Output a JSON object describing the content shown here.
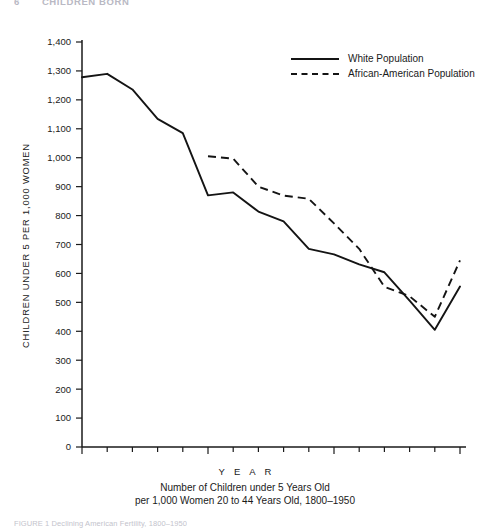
{
  "page": {
    "running_head": {
      "number": "6",
      "text": "CHILDREN BORN"
    },
    "source_note": "FIGURE 1  Declining American Fertility, 1800–1950"
  },
  "legend": {
    "position": "top-right",
    "items": [
      {
        "label": "White Population",
        "style": "solid"
      },
      {
        "label": "African-American Population",
        "style": "dashed"
      }
    ]
  },
  "labels": {
    "ylabel": "CHILDREN UNDER 5 PER 1,000 WOMEN",
    "xlabel": "Y E A R",
    "caption_line1": "Number of Children under 5 Years Old",
    "caption_line2": "per 1,000 Women 20 to 44 Years Old, 1800–1950"
  },
  "chart_data": {
    "type": "line",
    "title": "Number of Children under 5 Years Old per 1,000 Women 20 to 44 Years Old, 1800–1950",
    "xlabel": "YEAR",
    "ylabel": "CHILDREN UNDER 5 PER 1,000 WOMEN",
    "xlim": [
      1800,
      1950
    ],
    "ylim": [
      0,
      1400
    ],
    "grid": false,
    "legend_position": "top-right",
    "xticks_major": [
      1800,
      1850,
      1900,
      1950
    ],
    "xtick_labels": [
      "1800",
      "1850",
      "1900",
      "1950"
    ],
    "xtick_step_minor": 10,
    "yticks": [
      0,
      100,
      200,
      300,
      400,
      500,
      600,
      700,
      800,
      900,
      1000,
      1100,
      1200,
      1300,
      1400
    ],
    "ytick_labels": [
      "0",
      "100",
      "200",
      "300",
      "400",
      "500",
      "600",
      "700",
      "800",
      "900",
      "1,000",
      "1,100",
      "1,200",
      "1,300",
      "1,400"
    ],
    "series": [
      {
        "name": "White Population",
        "style": "solid",
        "x": [
          1800,
          1810,
          1820,
          1830,
          1840,
          1850,
          1860,
          1870,
          1880,
          1890,
          1900,
          1910,
          1920,
          1930,
          1940,
          1950
        ],
        "values": [
          1278,
          1290,
          1236,
          1134,
          1085,
          870,
          880,
          814,
          780,
          685,
          666,
          631,
          604,
          506,
          405,
          555
        ]
      },
      {
        "name": "African-American Population",
        "style": "dashed",
        "x": [
          1850,
          1860,
          1870,
          1880,
          1890,
          1900,
          1910,
          1920,
          1930,
          1940,
          1950
        ],
        "values": [
          1005,
          997,
          900,
          869,
          858,
          773,
          685,
          554,
          521,
          450,
          645
        ]
      }
    ]
  }
}
